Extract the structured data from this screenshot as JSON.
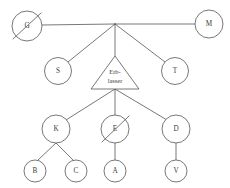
{
  "diagram": {
    "background_color": "#ffffff",
    "line_color": "#555555",
    "text_color": "#3a3a3a",
    "width": 230,
    "height": 188,
    "nodes": [
      {
        "id": "G",
        "label": "G",
        "shape": "circle",
        "cx": 27,
        "cy": 26,
        "r": 15,
        "struck": true,
        "row": 1
      },
      {
        "id": "M",
        "label": "M",
        "shape": "circle",
        "cx": 209,
        "cy": 24,
        "r": 14,
        "struck": false,
        "row": 1
      },
      {
        "id": "S",
        "label": "S",
        "shape": "circle",
        "cx": 58,
        "cy": 71,
        "r": 13.5,
        "struck": false,
        "row": 2
      },
      {
        "id": "Erblasser",
        "label": "Erb-lasser",
        "label_line1": "Erb-",
        "label_line2": "lasser",
        "shape": "triangle",
        "cx": 115,
        "cy": 74,
        "half_width": 24,
        "apex_y": 56,
        "base_y": 89,
        "struck": false,
        "row": 2
      },
      {
        "id": "T",
        "label": "T",
        "shape": "circle",
        "cx": 175,
        "cy": 71,
        "r": 13.5,
        "struck": false,
        "row": 2
      },
      {
        "id": "K",
        "label": "K",
        "shape": "circle",
        "cx": 56,
        "cy": 129,
        "r": 14,
        "struck": false,
        "row": 3
      },
      {
        "id": "E",
        "label": "E",
        "shape": "circle",
        "cx": 115,
        "cy": 129,
        "r": 14,
        "struck": true,
        "row": 3
      },
      {
        "id": "D",
        "label": "D",
        "shape": "circle",
        "cx": 176,
        "cy": 129,
        "r": 14,
        "struck": false,
        "row": 3
      },
      {
        "id": "B",
        "label": "B",
        "shape": "circle",
        "cx": 35,
        "cy": 171,
        "r": 11,
        "struck": false,
        "row": 4
      },
      {
        "id": "C",
        "label": "C",
        "shape": "circle",
        "cx": 76,
        "cy": 171,
        "r": 11,
        "struck": false,
        "row": 4
      },
      {
        "id": "A",
        "label": "A",
        "shape": "circle",
        "cx": 115,
        "cy": 171,
        "r": 11,
        "struck": false,
        "row": 4
      },
      {
        "id": "V",
        "label": "V",
        "shape": "circle",
        "cx": 176,
        "cy": 171,
        "r": 11,
        "struck": false,
        "row": 4
      }
    ],
    "junction": {
      "x": 115,
      "y": 24
    },
    "edges": [
      {
        "from": "G",
        "to": "junction",
        "kind": "spouse-line"
      },
      {
        "from": "junction",
        "to": "M",
        "kind": "spouse-line"
      },
      {
        "from": "junction",
        "to": "S",
        "kind": "descent"
      },
      {
        "from": "junction",
        "to": "Erblasser",
        "kind": "descent"
      },
      {
        "from": "junction",
        "to": "T",
        "kind": "descent"
      },
      {
        "from": "Erblasser",
        "to": "K",
        "kind": "descent"
      },
      {
        "from": "Erblasser",
        "to": "E",
        "kind": "descent"
      },
      {
        "from": "Erblasser",
        "to": "D",
        "kind": "descent"
      },
      {
        "from": "K",
        "to": "B",
        "kind": "descent"
      },
      {
        "from": "K",
        "to": "C",
        "kind": "descent"
      },
      {
        "from": "E",
        "to": "A",
        "kind": "descent"
      },
      {
        "from": "D",
        "to": "V",
        "kind": "descent"
      }
    ]
  }
}
